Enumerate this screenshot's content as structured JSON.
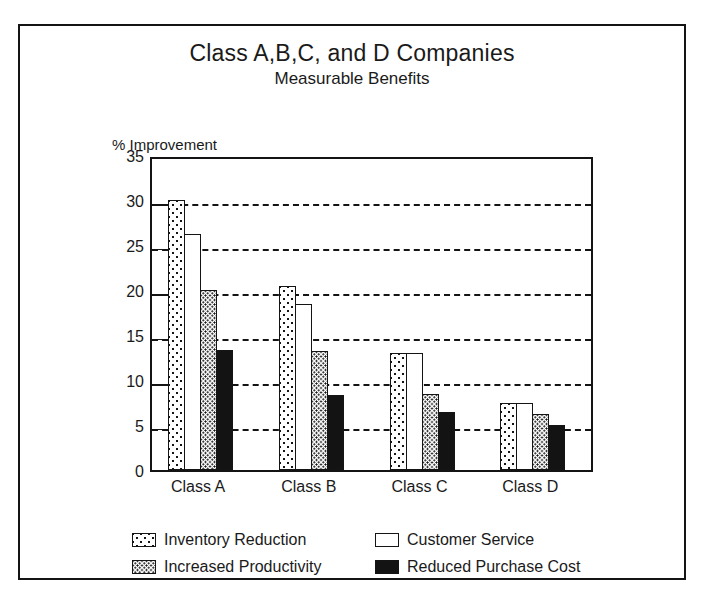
{
  "chart_data": {
    "type": "bar",
    "title": "Class A,B,C, and D Companies",
    "subtitle": "Measurable Benefits",
    "xlabel": "",
    "ylabel": "% Improvement",
    "ylim": [
      0,
      35
    ],
    "ytick_step": 5,
    "yticks": [
      "0",
      "5",
      "10",
      "15",
      "20",
      "25",
      "30",
      "35"
    ],
    "grid": true,
    "grid_style": "dashed-horizontal",
    "legend_position": "below-axis",
    "categories": [
      "Class A",
      "Class B",
      "Class C",
      "Class D"
    ],
    "series": [
      {
        "name": "Inventory Reduction",
        "pattern": "sparse-dots",
        "color": "#ffffff",
        "values": [
          30,
          20.5,
          13,
          7.5
        ]
      },
      {
        "name": "Customer Service",
        "pattern": "solid-white",
        "color": "#ffffff",
        "values": [
          26.2,
          18.5,
          13,
          7.5
        ]
      },
      {
        "name": "Increased Productivity",
        "pattern": "dense-dots",
        "color": "#ffffff",
        "values": [
          20,
          13.2,
          8.4,
          6.2
        ]
      },
      {
        "name": "Reduced Purchase Cost",
        "pattern": "solid-black",
        "color": "#131313",
        "values": [
          13.3,
          8.3,
          6.5,
          5
        ]
      }
    ]
  },
  "legend": {
    "items": [
      {
        "label": "Inventory Reduction",
        "swatch": "sparse-dots"
      },
      {
        "label": "Customer Service",
        "swatch": "solid-white"
      },
      {
        "label": "Increased Productivity",
        "swatch": "dense-dots"
      },
      {
        "label": "Reduced Purchase Cost",
        "swatch": "solid-black"
      }
    ]
  },
  "colors": {
    "ink": "#141414",
    "background": "#ffffff",
    "bar_black": "#131313"
  }
}
